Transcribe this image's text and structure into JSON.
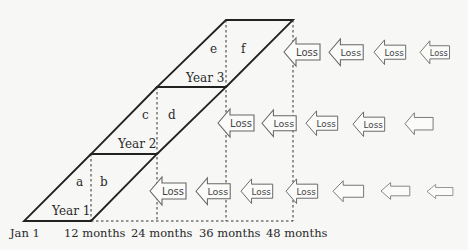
{
  "diagram": {
    "type": "annual-cohort-loss-development",
    "years": [
      {
        "label": "Year 1",
        "left_region": "a",
        "right_region": "b"
      },
      {
        "label": "Year 2",
        "left_region": "c",
        "right_region": "d"
      },
      {
        "label": "Year 3",
        "left_region": "e",
        "right_region": "f"
      }
    ],
    "x_axis": [
      "Jan 1",
      "12 months",
      "24 months",
      "36 months",
      "48 months"
    ],
    "arrow_label": "Loss",
    "rows": [
      {
        "row": "Year 3",
        "labeled_arrows": 4,
        "blank_arrows": 0
      },
      {
        "row": "Year 2",
        "labeled_arrows": 4,
        "blank_arrows": 1
      },
      {
        "row": "Year 1",
        "labeled_arrows": 4,
        "blank_arrows": 3
      }
    ],
    "colors": {
      "line": "#222222",
      "arrow_stroke": "#666666",
      "background": "#f7f7f5"
    }
  }
}
